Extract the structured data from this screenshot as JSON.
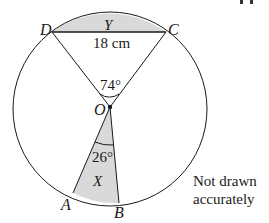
{
  "figure": {
    "points": {
      "D": "D",
      "C": "C",
      "O": "O",
      "A": "A",
      "B": "B"
    },
    "regions": {
      "Y": "Y",
      "X": "X"
    },
    "chord_length": "18 cm",
    "angle_DOC": "74°",
    "angle_AOB": "26°",
    "note_line1": "Not drawn",
    "note_line2": "accurately",
    "corner_fragment": "11"
  },
  "colors": {
    "stroke": "#1a1a1a",
    "shade": "#d9d9d9",
    "background": "#ffffff"
  }
}
